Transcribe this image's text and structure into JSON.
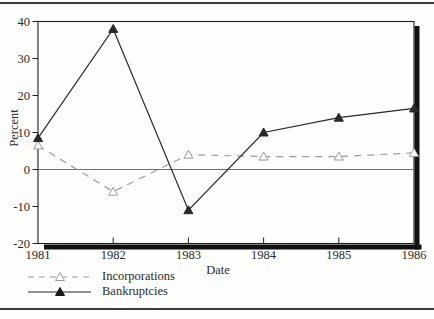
{
  "figure": {
    "background": "#fdfdfb",
    "rule_color": "#3a3a3a",
    "frame_color": "#1f1f1f",
    "zero_line_color": "#6f6f6f"
  },
  "chart_data": {
    "type": "line",
    "title": "",
    "xlabel": "Date",
    "ylabel": "Percent",
    "categories": [
      "1981",
      "1982",
      "1983",
      "1984",
      "1985",
      "1986"
    ],
    "y_ticks": [
      40,
      30,
      20,
      10,
      0,
      -10,
      -20
    ],
    "ylim": [
      -20,
      40
    ],
    "grid": false,
    "zero_line": true,
    "legend_position": "bottom-left",
    "series": [
      {
        "name": "Incorporations",
        "values": [
          6.5,
          -6,
          4,
          3.5,
          3.5,
          4.5
        ],
        "line_style": "dashed",
        "marker": "triangle-open",
        "color": "#9c9c9c"
      },
      {
        "name": "Bankruptcies",
        "values": [
          8.5,
          38,
          -11,
          10,
          14,
          16.5
        ],
        "line_style": "solid",
        "marker": "triangle-filled",
        "color": "#282828"
      }
    ]
  }
}
